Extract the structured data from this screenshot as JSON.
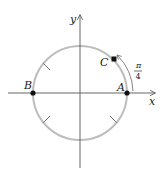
{
  "diagram": {
    "axes": {
      "x_label": "x",
      "y_label": "y"
    },
    "circle": {
      "center": [
        80,
        93
      ],
      "radius": 47,
      "color": "#bbbbbb"
    },
    "points": [
      {
        "name": "A",
        "angle": "0",
        "filled": true
      },
      {
        "name": "B",
        "angle": "π",
        "filled": true
      },
      {
        "name": "C",
        "angle": "π/4",
        "filled": true,
        "marker": "square"
      }
    ],
    "arc_label": {
      "numerator": "π",
      "denominator": "4"
    },
    "tick_marks_at": [
      "3π/4",
      "5π/4",
      "7π/4"
    ]
  }
}
